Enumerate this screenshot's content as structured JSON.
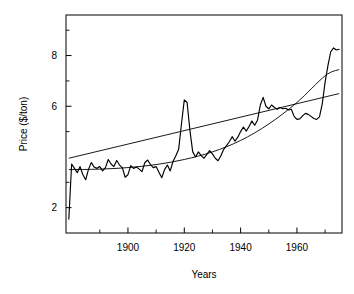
{
  "chart_data": {
    "type": "line",
    "title": "",
    "xlabel": "Years",
    "ylabel": "Price ($/ton)",
    "xlim": [
      1878,
      1976
    ],
    "ylim": [
      1.0,
      9.6
    ],
    "grid": false,
    "legend": null,
    "xticks": [
      1900,
      1920,
      1940,
      1960
    ],
    "xtick_labels": [
      "1900",
      "1920",
      "1940",
      "1960"
    ],
    "x_minor_ticks": [
      1890,
      1910,
      1930,
      1950,
      1970
    ],
    "yticks": [
      8,
      6,
      2
    ],
    "ytick_labels": [
      "8",
      "6",
      "2"
    ],
    "y_minor_ticks": [
      9,
      7,
      5,
      3
    ],
    "series": [
      {
        "name": "price",
        "style": "jagged-observed",
        "x": [
          1879,
          1880,
          1881,
          1882,
          1883,
          1884,
          1885,
          1886,
          1887,
          1888,
          1889,
          1890,
          1891,
          1892,
          1893,
          1894,
          1895,
          1896,
          1897,
          1898,
          1899,
          1900,
          1901,
          1902,
          1903,
          1904,
          1905,
          1906,
          1907,
          1908,
          1909,
          1910,
          1911,
          1912,
          1913,
          1914,
          1915,
          1916,
          1917,
          1918,
          1919,
          1920,
          1921,
          1922,
          1923,
          1924,
          1925,
          1926,
          1927,
          1928,
          1929,
          1930,
          1931,
          1932,
          1933,
          1934,
          1935,
          1936,
          1937,
          1938,
          1939,
          1940,
          1941,
          1942,
          1943,
          1944,
          1945,
          1946,
          1947,
          1948,
          1949,
          1950,
          1951,
          1952,
          1953,
          1954,
          1955,
          1956,
          1957,
          1958,
          1959,
          1960,
          1961,
          1962,
          1963,
          1964,
          1965,
          1966,
          1967,
          1968,
          1969,
          1970,
          1971,
          1972,
          1973,
          1974,
          1975
        ],
        "y": [
          1.55,
          3.72,
          3.55,
          3.38,
          3.62,
          3.3,
          3.1,
          3.52,
          3.78,
          3.6,
          3.55,
          3.62,
          3.45,
          3.58,
          3.9,
          3.72,
          3.62,
          3.86,
          3.68,
          3.58,
          3.2,
          3.3,
          3.66,
          3.55,
          3.6,
          3.52,
          3.42,
          3.78,
          3.88,
          3.7,
          3.58,
          3.62,
          3.4,
          3.18,
          3.5,
          3.68,
          3.45,
          3.82,
          4.05,
          4.3,
          5.3,
          6.25,
          6.15,
          5.05,
          4.2,
          4.0,
          4.2,
          4.05,
          3.95,
          4.1,
          4.25,
          4.12,
          3.95,
          3.85,
          4.05,
          4.3,
          4.45,
          4.6,
          4.8,
          4.62,
          4.78,
          5.0,
          5.18,
          5.02,
          5.2,
          5.42,
          5.25,
          5.45,
          6.05,
          6.35,
          6.0,
          5.9,
          6.05,
          5.95,
          5.88,
          5.95,
          5.9,
          5.92,
          5.85,
          5.88,
          5.6,
          5.48,
          5.5,
          5.62,
          5.72,
          5.68,
          5.6,
          5.52,
          5.48,
          5.58,
          6.1,
          6.95,
          7.6,
          8.15,
          8.3,
          8.22,
          8.25
        ]
      },
      {
        "name": "trend-upper",
        "style": "straight-fit",
        "x": [
          1879,
          1975
        ],
        "y": [
          3.95,
          6.5
        ]
      },
      {
        "name": "trend-curve",
        "style": "curved-fit",
        "x": [
          1879,
          1890,
          1900,
          1910,
          1920,
          1930,
          1940,
          1950,
          1960,
          1970,
          1975
        ],
        "y": [
          3.5,
          3.52,
          3.58,
          3.7,
          3.9,
          4.2,
          4.65,
          5.3,
          6.15,
          7.2,
          7.45
        ]
      }
    ]
  }
}
